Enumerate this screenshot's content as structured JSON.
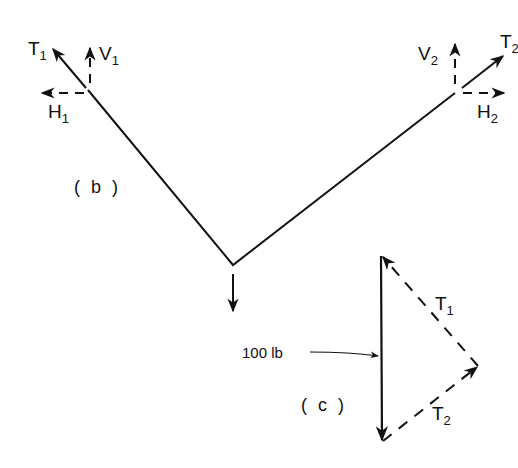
{
  "figure": {
    "colors": {
      "ink": "#111111",
      "background": "#ffffff"
    },
    "panel_b": {
      "label": "( b )",
      "left_support": {
        "tension": {
          "main": "T",
          "sub": "1"
        },
        "vertical": {
          "main": "V",
          "sub": "1"
        },
        "horizontal": {
          "main": "H",
          "sub": "1"
        }
      },
      "right_support": {
        "tension": {
          "main": "T",
          "sub": "2"
        },
        "vertical": {
          "main": "V",
          "sub": "2"
        },
        "horizontal": {
          "main": "H",
          "sub": "2"
        }
      },
      "load_arrow": "down-arrow"
    },
    "panel_c": {
      "label": "( c )",
      "weight_label": "100 lb",
      "t1": {
        "main": "T",
        "sub": "1"
      },
      "t2": {
        "main": "T",
        "sub": "2"
      }
    }
  }
}
